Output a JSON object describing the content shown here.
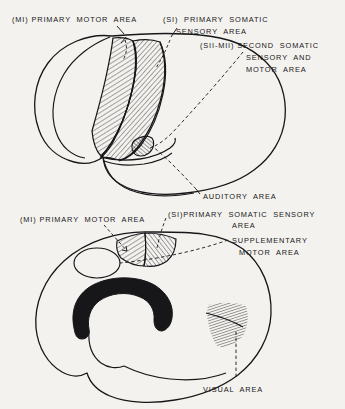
{
  "figure": {
    "background_color": "#f4f2ee",
    "ink_color": "#17171a",
    "views": [
      {
        "name": "lateral-view",
        "position": "top",
        "description": "Lateral (side) view of cerebral hemisphere"
      },
      {
        "name": "medial-view",
        "position": "bottom",
        "description": "Medial (mid-sagittal) view of cerebral hemisphere"
      }
    ]
  },
  "labels": {
    "lateral": {
      "primary_motor": {
        "prefix": "(M",
        "numeral": "I",
        "suffix": ")",
        "line1": "(MI) PRIMARY  MOTOR  AREA"
      },
      "primary_somatic_sensory": {
        "line1": "(SI)  PRIMARY  SOMATIC",
        "line2": "SENSORY  AREA"
      },
      "second_somatic": {
        "line1": "(SII-MII) SECOND  SOMATIC",
        "line2": "SENSORY  AND",
        "line3": "MOTOR  AREA"
      },
      "auditory": {
        "line1": "AUDITORY  AREA"
      }
    },
    "medial": {
      "primary_motor": {
        "line1": "(MI) PRIMARY  MOTOR  AREA"
      },
      "primary_somatic_sensory": {
        "line1": "(SI)PRIMARY  SOMATIC  SENSORY",
        "line2": "AREA"
      },
      "supplementary_motor": {
        "line1": "SUPPLEMENTARY",
        "line2": "MOTOR  AREA"
      },
      "visual": {
        "line1": "VISUAL  AREA"
      }
    }
  },
  "regions": [
    {
      "name": "primary-motor-area-lateral",
      "style": "diagonal-hatch",
      "view": "lateral"
    },
    {
      "name": "primary-somatic-sensory-area-lateral",
      "style": "diagonal-hatch",
      "view": "lateral"
    },
    {
      "name": "second-somatic-sensory-motor-area",
      "style": "small-hatch",
      "view": "lateral"
    },
    {
      "name": "primary-motor-area-medial",
      "style": "diagonal-hatch",
      "view": "medial"
    },
    {
      "name": "primary-somatic-sensory-area-medial",
      "style": "diagonal-hatch",
      "view": "medial"
    },
    {
      "name": "corpus-callosum",
      "style": "solid-black",
      "view": "medial"
    },
    {
      "name": "visual-area",
      "style": "dense-hatch",
      "view": "medial"
    }
  ]
}
